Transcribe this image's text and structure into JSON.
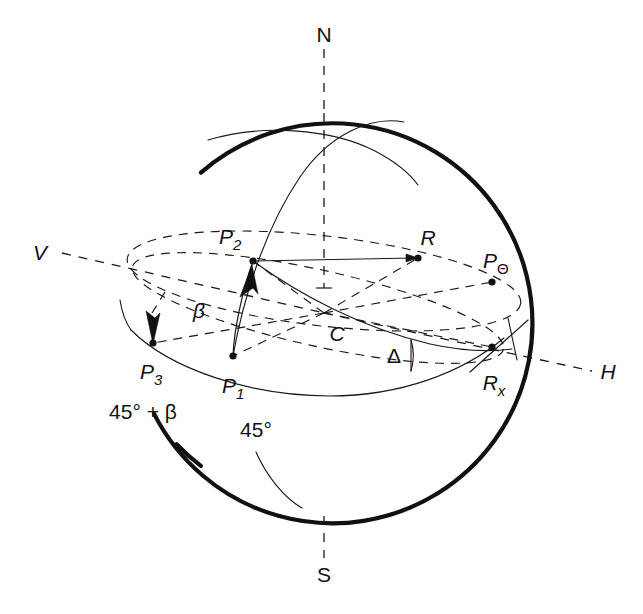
{
  "figure": {
    "type": "geometric-diagram",
    "background_color": "#ffffff",
    "line_color": "#111111",
    "sphere": {
      "center_x": 324,
      "center_y": 313,
      "radius": 200,
      "outline_style": "thick-solid"
    }
  },
  "cardinal_labels": {
    "north": "N",
    "south": "S",
    "vertical_axis": "V",
    "horizontal_axis": "H"
  },
  "points": [
    {
      "id": "P2",
      "base": "P",
      "sub": "2",
      "x": 253,
      "y": 261
    },
    {
      "id": "P3",
      "base": "P",
      "sub": "3",
      "x": 153,
      "y": 343
    },
    {
      "id": "P1",
      "base": "P",
      "sub": "1",
      "x": 233,
      "y": 356
    },
    {
      "id": "R",
      "base": "R",
      "sub": "",
      "x": 418,
      "y": 258
    },
    {
      "id": "PTheta",
      "base": "P",
      "sub": "Θ",
      "x": 492,
      "y": 282
    },
    {
      "id": "Rx",
      "base": "R",
      "sub": "x",
      "x": 492,
      "y": 347
    },
    {
      "id": "C",
      "base": "C",
      "sub": "",
      "x": 335,
      "y": 334
    }
  ],
  "point_labels": {
    "P2": "P",
    "P2_sub": "2",
    "P3": "P",
    "P3_sub": "3",
    "P1": "P",
    "P1_sub": "1",
    "R": "R",
    "PTheta": "P",
    "PTheta_sub": "Θ",
    "Rx": "R",
    "Rx_sub": "x",
    "C": "C"
  },
  "angle_labels": {
    "beta": "β",
    "delta": "Δ",
    "forty_five_plus_beta": "45° + β",
    "forty_five": "45°"
  },
  "annotations": {
    "beta_note": "angle beta between P1-P2 meridian arc",
    "delta_note": "angle Delta at R_x between equatorial arc and tilted great circle"
  }
}
